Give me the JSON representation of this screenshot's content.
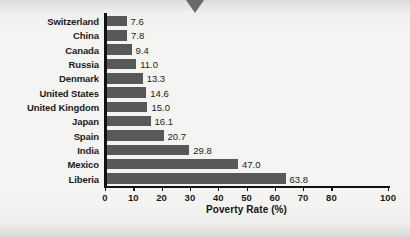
{
  "chart_data": {
    "type": "bar",
    "orientation": "horizontal",
    "title": "",
    "xlabel": "Poverty Rate (%)",
    "ylabel": "",
    "xlim": [
      0,
      100
    ],
    "grid": false,
    "legend": null,
    "bar_color": "#585858",
    "axis_color": "#111111",
    "categories": [
      "Switzerland",
      "China",
      "Canada",
      "Russia",
      "Denmark",
      "United States",
      "United Kingdom",
      "Japan",
      "Spain",
      "India",
      "Mexico",
      "Liberia"
    ],
    "values": [
      7.6,
      7.8,
      9.4,
      11.0,
      13.3,
      14.6,
      15.0,
      16.1,
      20.7,
      29.8,
      47.0,
      63.8
    ],
    "value_labels": [
      "7.6",
      "7.8",
      "9.4",
      "11.0",
      "13.3",
      "14.6",
      "15.0",
      "16.1",
      "20.7",
      "29.8",
      "47.0",
      "63.8"
    ],
    "xticks": [
      0,
      10,
      20,
      30,
      40,
      50,
      60,
      70,
      80,
      100
    ],
    "xtick_labels": [
      "0",
      "10",
      "20",
      "30",
      "40",
      "50",
      "60",
      "70",
      "80",
      "100"
    ]
  }
}
